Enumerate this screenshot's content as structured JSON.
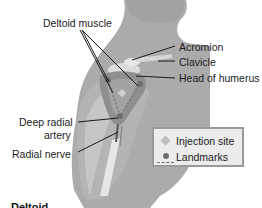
{
  "figure": {
    "labels": {
      "deltoid_muscle": "Deltoid muscle",
      "acromion": "Acromion",
      "clavicle": "Clavicle",
      "head_of_humerus": "Head of humerus",
      "deep_radial_artery_line1": "Deep radial",
      "deep_radial_artery_line2": "artery",
      "radial_nerve": "Radial nerve"
    },
    "legend": {
      "items": [
        {
          "symbol": "diamond",
          "label": "Injection site"
        },
        {
          "symbol": "dot-dashed",
          "label": "Landmarks"
        }
      ]
    },
    "caption": "Deltoid",
    "colors": {
      "background": "#ffffff",
      "body": "#a9a9a9",
      "body_light": "#c4c4c4",
      "muscle": "#8e8e8e",
      "bone": "#dedede",
      "legend_bg": "#ececec",
      "legend_border": "#9a9a9a",
      "leader_line": "#1a1a1a"
    }
  }
}
